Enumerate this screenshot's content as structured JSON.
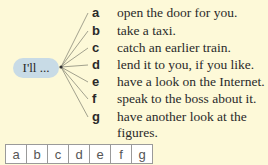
{
  "prompt": {
    "stem": "I'll ..."
  },
  "items": [
    {
      "letter": "a",
      "text": "open the door for you."
    },
    {
      "letter": "b",
      "text": "take a taxi."
    },
    {
      "letter": "c",
      "text": "catch an earlier train."
    },
    {
      "letter": "d",
      "text": "lend it to you, if you like."
    },
    {
      "letter": "e",
      "text": "have a look on the Internet."
    },
    {
      "letter": "f",
      "text": "speak to the boss about it."
    },
    {
      "letter": "g",
      "text": "have another look at the",
      "text2": "figures."
    }
  ],
  "answer_grid": {
    "cells": [
      "a",
      "b",
      "c",
      "d",
      "e",
      "f",
      "g"
    ]
  },
  "colors": {
    "background": "#fdf9d8",
    "pill": "#c8dbe6",
    "lines": "#8a8a7a"
  }
}
